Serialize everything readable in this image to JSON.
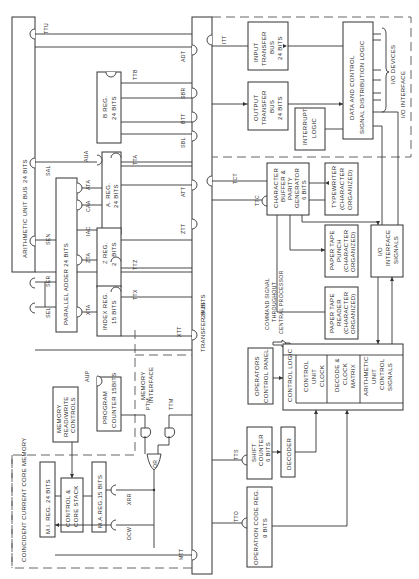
{
  "diagram": {
    "orientation": "rotated 90 degrees counter-clockwise",
    "buses": {
      "arithmetic_unit_bus": "ARITHMETIC UNIT BUS",
      "arithmetic_bus_width": "24 BITS",
      "transfer_bus": "TRANSFER BUS",
      "transfer_bus_width": "24 BITS"
    },
    "arithmetic": {
      "b_reg": [
        "B REG.",
        "24 BITS"
      ],
      "a_reg": [
        "A. REG.",
        "24 BITS"
      ],
      "z_reg": [
        "Z REG.",
        "24 BITS"
      ],
      "index_reg": [
        "INDEX REG.",
        "15 BITS"
      ],
      "parallel_adder": "PARALLEL ADDER  24 BITS"
    },
    "memory": {
      "region_label": "COINCIDENT CURRENT CORE MEMORY",
      "mi_reg": "M.I. REG.  24 BITS",
      "control_core_stack": [
        "CONTROL &",
        "CORE STACK"
      ],
      "ma_reg": "M.A.REG.15 BITS",
      "read_write_controls": [
        "MEMORY",
        "READ/WRITE",
        "CONTROLS"
      ],
      "program_counter": [
        "PROGRAM",
        "COUNTER 15BITS"
      ],
      "memory_interface": [
        "MEMORY",
        "INTERFACE"
      ],
      "or_gate": "OR"
    },
    "io": {
      "region_label": "I/O INTERFACE",
      "input_transfer_bus": [
        "INPUT",
        "TRANSFER",
        "BUS",
        "24 BITS"
      ],
      "output_transfer_bus": [
        "OUTPUT",
        "TRANSFER",
        "BUS",
        "24 BITS"
      ],
      "interrupt_logic": [
        "INTERRUPT",
        "LOGIC"
      ],
      "data_control_logic": [
        "DATA  AND CONTROL",
        "SIGNAL DISTRIBUTION  LOGIC"
      ],
      "io_devices": "I/O DEVICES"
    },
    "peripherals": {
      "char_buffer": [
        "CHARACTER",
        "BUFFER &",
        "PARITY",
        "GENERATOR",
        "6 BITS"
      ],
      "typewriter": [
        "TYPEWRITER",
        "(CHARACTER",
        "ORGANIZED)"
      ],
      "paper_tape_punch": [
        "PAPER  TAPE",
        "PUNCH",
        "(CHARACTER",
        "ORGANIZED)"
      ],
      "paper_tape_reader": [
        "PAPER  TAPE",
        "READER",
        "(CHARACTER",
        "ORGANIZED)"
      ],
      "io_interface_signals": [
        "I/O",
        "INTERFACE",
        "SIGNALS"
      ]
    },
    "control": {
      "command_signal": [
        "COMMAND SIGNAL",
        "THROUGHOUT",
        "CENTRAL PROCESSOR"
      ],
      "operators_panel": [
        "OPERATORS",
        "CONTROL PANEL"
      ],
      "control_logic": "CONTROL  LOGIC",
      "control_unit_clock": [
        "CONTROL",
        "UNIT",
        "CLOCK"
      ],
      "decode_clock_matrix": [
        "DECODE &",
        "CLOCK",
        "MATRIX"
      ],
      "arith_control_signals": [
        "ARITHMETIC",
        "UNIT",
        "CONTROL",
        "SIGNALS"
      ],
      "shift_counter": [
        "SHIFT",
        "COUNTER",
        "6 BITS"
      ],
      "decoder": "DECODER",
      "op_code_reg": [
        "OPERATION CODE REG.",
        "9 BITS"
      ]
    },
    "gate_labels": {
      "ttu": "TTU",
      "adt": "ADT",
      "ttb": "TTB",
      "sbr": "SBR",
      "btt": "BTT",
      "sbl": "SBL",
      "aua": "AUA",
      "tta": "TTA",
      "sal": "SAL",
      "ata": "ATA",
      "att": "ATT",
      "caa": "CAA",
      "iac": "IAC",
      "sen": "SEN",
      "zta": "ZTA",
      "ttz": "TTZ",
      "ztt": "ZTT",
      "ser": "SER",
      "sel": "SEL",
      "xta": "XTA",
      "ttx": "TTX",
      "xtt": "XTT",
      "aup": "AUP",
      "ptm": "PTM",
      "ttm": "TTM",
      "xrr": "XRR",
      "dcw": "DCW",
      "mtt": "MTT",
      "itt": "ITT",
      "tct": "TCT",
      "ttc": "TTC",
      "tts": "TTS",
      "tto": "TTO"
    }
  }
}
